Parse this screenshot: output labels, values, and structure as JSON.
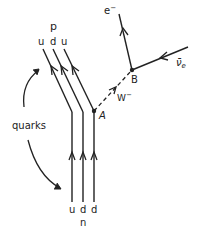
{
  "diagram": {
    "proton": {
      "label": "p",
      "quarks": [
        "u",
        "d",
        "u"
      ]
    },
    "neutron": {
      "label": "n",
      "quarks": [
        "u",
        "d",
        "d"
      ]
    },
    "annotation": {
      "quarks_label": "quarks"
    },
    "vertices": {
      "a": "A",
      "b": "B"
    },
    "particles": {
      "boson": "W",
      "boson_sup": "−",
      "electron": "e",
      "electron_sup": "−",
      "antineutrino": "ν̄",
      "antineutrino_sub": "e"
    },
    "colors": {
      "line": "#222222",
      "background": "#ffffff"
    }
  }
}
